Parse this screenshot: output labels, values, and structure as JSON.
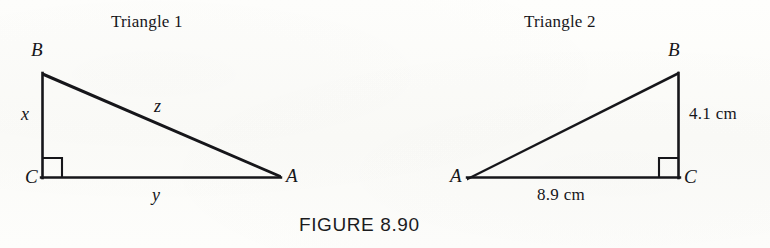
{
  "figure": {
    "caption": "FIGURE 8.90",
    "ink_color": "#16161a",
    "background_color": "#fdfdfb"
  },
  "panels": [
    {
      "heading": "Triangle 1",
      "vertices": {
        "A": "A",
        "B": "B",
        "C": "C"
      },
      "right_angle_at": "C",
      "sides": {
        "vertical_leg": "x",
        "horizontal_leg": "y",
        "hypotenuse": "z"
      }
    },
    {
      "heading": "Triangle 2",
      "vertices": {
        "A": "A",
        "B": "B",
        "C": "C"
      },
      "right_angle_at": "C",
      "sides": {
        "vertical_leg": "4.1 cm",
        "horizontal_leg": "8.9 cm"
      }
    }
  ]
}
